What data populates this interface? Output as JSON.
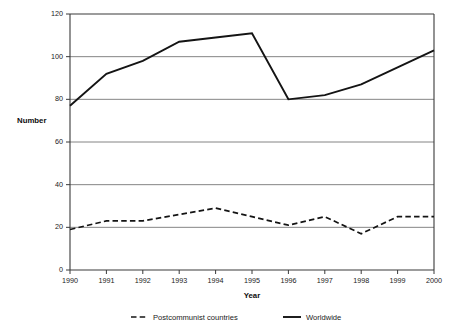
{
  "chart_data": {
    "type": "line",
    "title": "",
    "xlabel": "Year",
    "ylabel": "Number",
    "x": [
      1990,
      1991,
      1992,
      1993,
      1994,
      1995,
      1996,
      1997,
      1998,
      1999,
      2000
    ],
    "xticklabels": [
      "1990",
      "1991",
      "1992",
      "1993",
      "1994",
      "1995",
      "1996",
      "1997",
      "1998",
      "1999",
      "2000"
    ],
    "yticklabels": [
      "0",
      "20",
      "40",
      "60",
      "80",
      "100",
      "120"
    ],
    "yticks": [
      0,
      20,
      40,
      60,
      80,
      100,
      120
    ],
    "ylim": [
      0,
      120
    ],
    "xlim": [
      1990,
      2000
    ],
    "grid": "horizontal",
    "legend_position": "bottom",
    "series": [
      {
        "name": "Postcommunist countries",
        "style": "dashed",
        "color": "#141414",
        "values": [
          19,
          23,
          23,
          26,
          29,
          25,
          21,
          25,
          17,
          25,
          25
        ]
      },
      {
        "name": "Worldwide",
        "style": "solid",
        "color": "#141414",
        "values": [
          77,
          92,
          98,
          107,
          109,
          111,
          80,
          82,
          87,
          95,
          103
        ]
      }
    ]
  },
  "axes": {
    "ylabel_text": "Number",
    "xlabel_text": "Year"
  },
  "legend": {
    "items": [
      {
        "label": "Postcommunist countries",
        "style": "dashed"
      },
      {
        "label": "Worldwide",
        "style": "solid"
      }
    ]
  },
  "colors": {
    "line": "#141414",
    "grid": "#666666",
    "axis": "#3a3a3a",
    "background": "#ffffff"
  }
}
